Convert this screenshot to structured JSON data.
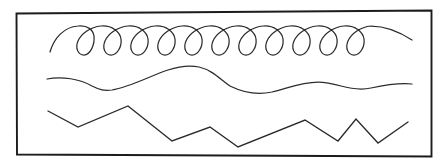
{
  "figure": {
    "background_color": "#ffffff",
    "ink_color": "#2b2b2b",
    "frame_color": "#1c1c1c",
    "width": 447,
    "height": 168
  },
  "frame": {
    "name": "rectangular border",
    "stroke_color": "#1c1c1c",
    "stroke_width": 1.9,
    "corners": {
      "top_left": [
        16,
        13
      ],
      "top_right": [
        432,
        10
      ],
      "bottom_right": [
        432,
        157
      ],
      "bottom_left": [
        17,
        155
      ]
    },
    "path": "M 16.5 13.5 L 431.5 10.5 L 431.5 156.5 L 17.0 154.5 Z"
  },
  "lines": [
    {
      "id": "looped-curl-line",
      "label": "Looped curl line",
      "description": "Chain of eight downward teardrop loops joined by upward arches",
      "loop_count": 8,
      "arch_top_y": 26,
      "loop_bottom_y": 55,
      "crossing_y": 33,
      "loop_width": 13,
      "start_point": [
        50,
        52
      ],
      "end_point": [
        412,
        40
      ],
      "loop_centers_x": [
        90,
        129,
        168,
        207,
        245,
        284,
        323,
        362
      ],
      "stroke_width": 1.25,
      "path": "M 50 52 C 54 38 64 27 78 26 C 88 25 93 30 94 36 C 95 45 90 55 84 55 C 78 55 75 48 78 41 C 81 34 90 27 101 26 C 112 25 120 32 121 39 C 122 47 117 55 111 55 C 105 55 102 48 105 41 C 108 34 117 27 128 26 C 139 25 147 32 148 39 C 149 47 144 55 138 55 C 132 55 129 48 132 41 C 135 34 144 27 155 26 C 166 25 174 32 175 39 C 176 47 171 55 165 55 C 159 55 156 48 159 41 C 162 34 171 27 182 26 C 193 25 201 32 202 39 C 203 47 198 55 192 55 C 186 55 183 48 186 41 C 189 34 198 27 209 26 C 220 25 228 32 229 39 C 230 47 225 55 219 55 C 213 55 210 48 213 41 C 216 34 225 27 236 26 C 247 25 255 32 256 39 C 257 47 252 55 246 55 C 240 55 237 48 240 41 C 243 34 252 27 263 26 C 274 25 282 32 283 39 C 284 47 279 55 273 55 C 267 55 264 48 267 41 C 270 34 279 27 290 26 C 301 25 309 32 310 39 C 311 47 306 55 300 55 C 294 55 291 48 294 41 C 297 34 306 27 317 26 C 328 25 336 32 337 39 C 338 47 333 55 327 55 C 321 55 318 48 321 41 C 324 34 333 27 344 26 C 355 25 363 32 364 39 C 365 47 360 55 354 55 C 348 55 345 48 348 41 C 351 34 360 27 371 26 C 385 26 400 32 412 40"
    },
    {
      "id": "sinuous-wave-line",
      "label": "Sinuous wave line",
      "description": "Smooth freehand wave with a broad trough, a tall crest, a deep trough and shallow ripples",
      "start_point": [
        47,
        79
      ],
      "end_point": [
        412,
        84
      ],
      "crest_points": [
        [
          195,
          66
        ],
        [
          330,
          83
        ]
      ],
      "trough_points": [
        [
          105,
          90
        ],
        [
          275,
          92
        ],
        [
          372,
          89
        ]
      ],
      "stroke_width": 1.25,
      "path": "M 47 79 C 62 76 80 79 92 86 C 100 90 104 91 112 90 C 130 87 150 76 168 70 C 180 66 190 65 199 67 C 212 70 220 79 230 86 C 244 93 258 95 272 92 C 288 88 302 82 318 82 C 327 82 334 84 341 86 C 352 89 362 90 371 88 C 385 85 400 83 412 84"
    },
    {
      "id": "jagged-zigzag-line",
      "label": "Jagged zigzag line",
      "description": "Angular polyline of sharp peaks and valleys of uneven amplitude",
      "vertices": [
        [
          48,
          111
        ],
        [
          78,
          127
        ],
        [
          128,
          106
        ],
        [
          172,
          141
        ],
        [
          210,
          127
        ],
        [
          238,
          147
        ],
        [
          305,
          120
        ],
        [
          338,
          141
        ],
        [
          356,
          119
        ],
        [
          378,
          143
        ],
        [
          408,
          122
        ]
      ],
      "stroke_width": 1.35,
      "path": "M 48 111 L 78 127 L 128 106 L 172 141 L 210 127 L 238 147 L 305 120 L 338 141 L 356 119 L 378 143 L 408 122"
    }
  ]
}
